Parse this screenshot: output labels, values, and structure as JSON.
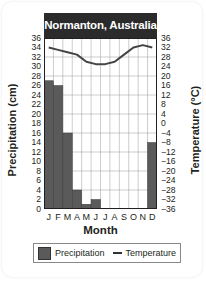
{
  "chart_data": {
    "type": "bar+line",
    "title": "Normanton, Australia",
    "xlabel": "Month",
    "categories": [
      "J",
      "F",
      "M",
      "A",
      "M",
      "J",
      "J",
      "A",
      "S",
      "O",
      "N",
      "D"
    ],
    "series": [
      {
        "name": "Precipitation",
        "type": "bar",
        "axis": "left",
        "unit": "cm",
        "color": "#5a5a5a",
        "values": [
          27,
          26,
          16,
          4,
          1,
          2,
          0,
          0,
          0,
          0,
          0,
          14
        ]
      },
      {
        "name": "Temperature",
        "type": "line",
        "axis": "right",
        "unit": "°C",
        "color": "#444444",
        "values": [
          32,
          31,
          30,
          29,
          26,
          25,
          25,
          26,
          29,
          32,
          33,
          32
        ]
      }
    ],
    "left_axis": {
      "label": "Precipitation (cm)",
      "ylim": [
        0,
        36
      ],
      "ticks": [
        36,
        34,
        32,
        30,
        28,
        26,
        24,
        22,
        20,
        18,
        16,
        14,
        12,
        10,
        8,
        6,
        4,
        2,
        0
      ]
    },
    "right_axis": {
      "label": "Temperature (°C)",
      "ylim": [
        -36,
        36
      ],
      "ticks": [
        36,
        32,
        28,
        24,
        20,
        16,
        12,
        8,
        4,
        0,
        -4,
        -8,
        -12,
        -16,
        -20,
        -24,
        -28,
        -32,
        -36
      ]
    },
    "grid": true,
    "legend": {
      "position": "bottom",
      "entries": [
        "Precipitation",
        "Temperature"
      ]
    }
  },
  "labels": {
    "title": "Normanton, Australia",
    "left_axis_title": "Precipitation (cm)",
    "right_axis_title": "Temperature (°C)",
    "x_axis_title": "Month",
    "legend_precip": "Precipitation",
    "legend_temp": "Temperature"
  }
}
